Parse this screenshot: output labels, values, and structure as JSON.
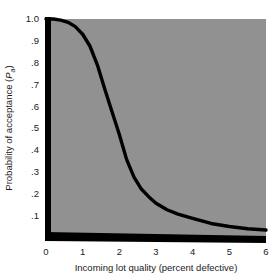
{
  "chart_data": {
    "type": "line",
    "title": "",
    "subtitle": "",
    "xlabel": "Incoming lot quality (percent defective)",
    "ylabel": "Probability of acceptance (Pa)",
    "ylabel_main": "Probability of acceptance (",
    "ylabel_symbol": "P",
    "ylabel_subscript": "a",
    "ylabel_close": ")",
    "xlim": [
      0,
      6
    ],
    "ylim": [
      0,
      1.0
    ],
    "grid": false,
    "legend": null,
    "legend_position": "none",
    "xticks": [
      "0",
      "1",
      "2",
      "3",
      "4",
      "5",
      "6"
    ],
    "xtick_values": [
      0,
      1,
      2,
      3,
      4,
      5,
      6
    ],
    "yticks": [
      "1.0",
      ".9",
      ".8",
      ".7",
      ".6",
      ".5",
      ".4",
      ".3",
      ".2",
      ".1"
    ],
    "ytick_values": [
      1.0,
      0.9,
      0.8,
      0.7,
      0.6,
      0.5,
      0.4,
      0.3,
      0.2,
      0.1
    ],
    "series": [
      {
        "name": "Operating characteristic curve",
        "x": [
          0.0,
          0.2,
          0.4,
          0.6,
          0.8,
          1.0,
          1.2,
          1.4,
          1.6,
          1.8,
          2.0,
          2.2,
          2.4,
          2.6,
          2.8,
          3.0,
          3.3,
          3.6,
          4.0,
          4.5,
          5.0,
          5.5,
          6.0
        ],
        "values": [
          1.0,
          1.0,
          0.995,
          0.985,
          0.965,
          0.93,
          0.875,
          0.79,
          0.68,
          0.575,
          0.47,
          0.355,
          0.275,
          0.22,
          0.185,
          0.155,
          0.125,
          0.105,
          0.085,
          0.062,
          0.048,
          0.038,
          0.032
        ]
      }
    ],
    "colors": {
      "plot_background": "#919191",
      "curve": "#000000",
      "axis": "#000000",
      "text": "#1a1a1a",
      "figure_background": "#ffffff"
    }
  },
  "figure": {
    "plot_area": {
      "left_px": 46,
      "top_px": 19,
      "right_px": 266,
      "bottom_px": 237
    }
  }
}
